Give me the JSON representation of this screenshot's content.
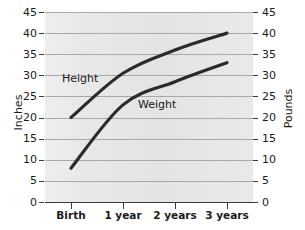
{
  "chart_data": {
    "type": "line",
    "title": "",
    "subtitle": "",
    "xlabel": "",
    "ylabel": "Inches",
    "y2label": "Pounds",
    "categories": [
      "Birth",
      "1 year",
      "2 years",
      "3 years"
    ],
    "x": [
      0,
      1,
      2,
      3
    ],
    "ylim": [
      0,
      45
    ],
    "y2lim": [
      0,
      45
    ],
    "yticks": [
      0,
      5,
      10,
      15,
      20,
      25,
      30,
      35,
      40,
      45
    ],
    "y2ticks": [
      0,
      5,
      10,
      15,
      20,
      25,
      30,
      35,
      40,
      45
    ],
    "grid": true,
    "legend_position": "inline-annotation",
    "series": [
      {
        "name": "Height",
        "axis": "left",
        "unit": "Inches",
        "values": [
          20,
          30.5,
          36,
          40
        ],
        "color": "#2b2b2b"
      },
      {
        "name": "Weight",
        "axis": "right",
        "unit": "Pounds",
        "values": [
          8,
          23,
          28.5,
          33
        ],
        "color": "#2b2b2b"
      }
    ],
    "annotations": [
      {
        "text": "Height",
        "series": "Height"
      },
      {
        "text": "Weight",
        "series": "Weight"
      }
    ],
    "plot_background": "#e7e7e7",
    "gridline_color": "#a8a8a8",
    "axis_color": "#3a3a3a",
    "figure_background": "#ffffff"
  }
}
